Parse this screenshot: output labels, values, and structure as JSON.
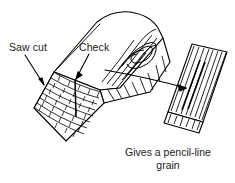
{
  "figure": {
    "type": "technical-line-drawing",
    "background_color": "#ffffff",
    "ink_color": "#000000",
    "text_color": "#1a1a1a"
  },
  "labels": {
    "saw_cut": "Saw cut",
    "check": "Check"
  },
  "caption": {
    "line1": "Gives a pencil-line",
    "line2": "grain"
  },
  "annotations": {
    "saw_cut_leader": "arrow from Saw cut label pointing down-right to left edge of wedge",
    "check_leader": "arrow from Check label pointing down to vertical split in end grain",
    "transfer_leader": "long arrow from log side grain to the sawn board at right"
  }
}
